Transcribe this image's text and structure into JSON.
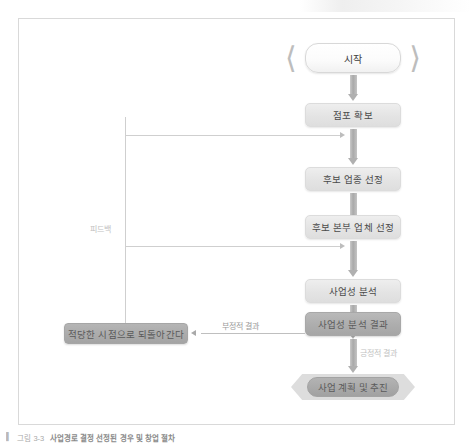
{
  "figure": {
    "title_caption_marker": "▌",
    "caption_label": "그림 3-3",
    "caption_text": "사업경로 결정 선정된 경우 및 창업 절차",
    "frame": {
      "border_color": "#d9d9d9",
      "background": "#ffffff"
    }
  },
  "palette": {
    "process_fill": "#e6e6e6",
    "result_fill": "#adadad",
    "return_fill": "#ababab",
    "start_fill": "#ffffff",
    "chevron": "#bdbdbd",
    "arrow": "#b0b0b0",
    "thin_line": "#cfcfcf",
    "text": "#4a4a4a",
    "edge_label_text": "#9a9a9a"
  },
  "flow": {
    "nodes": [
      {
        "id": "start",
        "label": "시작",
        "type": "terminator-start"
      },
      {
        "id": "secure-store",
        "label": "점포 확보",
        "type": "process"
      },
      {
        "id": "select-sector",
        "label": "후보 업종 선정",
        "type": "process"
      },
      {
        "id": "select-hq",
        "label": "후보 본부 업체 선정",
        "type": "process"
      },
      {
        "id": "feasibility",
        "label": "사업성 분석",
        "type": "process"
      },
      {
        "id": "result",
        "label": "사업성 분석 결과",
        "type": "result"
      },
      {
        "id": "go-back",
        "label": "적당한 시점으로 되돌아간다",
        "type": "return"
      },
      {
        "id": "end",
        "label": "사업 계획 및 추진",
        "type": "terminator-end"
      }
    ],
    "edge_labels": {
      "feedback": "피드백",
      "negative": "부정적 결과",
      "positive": "긍정적 결과"
    }
  }
}
